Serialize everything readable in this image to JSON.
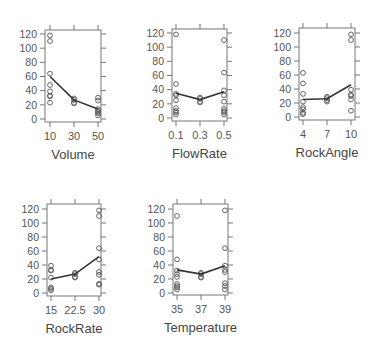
{
  "figure": {
    "title": "",
    "colors": {
      "text": "#555555",
      "box": "#777777",
      "points": "#555555",
      "trend": "#333333"
    }
  },
  "chart_data": [
    {
      "type": "scatter",
      "title": "",
      "xlabel": "Volume",
      "ylabel": "",
      "ylim": [
        0,
        120
      ],
      "yticks": [
        0,
        20,
        40,
        60,
        80,
        100,
        120
      ],
      "xticks": [
        10,
        30,
        50
      ],
      "xtick_labels": [
        "10",
        "30",
        "50"
      ],
      "grid": false,
      "points": [
        {
          "x": 10,
          "y": [
            118,
            110,
            64,
            48,
            39,
            33,
            32,
            23
          ]
        },
        {
          "x": 30,
          "y": [
            29,
            27,
            23,
            22
          ]
        },
        {
          "x": 50,
          "y": [
            30,
            26,
            14,
            12,
            10,
            8,
            5
          ]
        }
      ],
      "trend_line": [
        60,
        27,
        14
      ]
    },
    {
      "type": "scatter",
      "title": "",
      "xlabel": "FlowRate",
      "ylabel": "",
      "ylim": [
        0,
        120
      ],
      "yticks": [
        0,
        20,
        40,
        60,
        80,
        100,
        120
      ],
      "xticks": [
        0.1,
        0.3,
        0.5
      ],
      "xtick_labels": [
        "0.1",
        "0.3",
        "0.5"
      ],
      "grid": false,
      "points": [
        {
          "x": 0.1,
          "y": [
            118,
            48,
            34,
            32,
            25,
            14,
            10,
            8,
            5
          ]
        },
        {
          "x": 0.3,
          "y": [
            29,
            27,
            23,
            22
          ]
        },
        {
          "x": 0.5,
          "y": [
            110,
            64,
            39,
            32,
            23,
            13,
            10,
            8,
            5
          ]
        }
      ],
      "trend_line": [
        35,
        26,
        37
      ]
    },
    {
      "type": "scatter",
      "title": "",
      "xlabel": "RockAngle",
      "ylabel": "",
      "ylim": [
        0,
        120
      ],
      "yticks": [
        0,
        20,
        40,
        60,
        80,
        100,
        120
      ],
      "xticks": [
        4,
        7,
        10
      ],
      "xtick_labels": [
        "4",
        "7",
        "10"
      ],
      "grid": false,
      "points": [
        {
          "x": 4,
          "y": [
            63,
            48,
            33,
            22,
            14,
            11,
            6,
            4
          ]
        },
        {
          "x": 7,
          "y": [
            29,
            27,
            24,
            22
          ]
        },
        {
          "x": 10,
          "y": [
            118,
            110,
            39,
            32,
            30,
            25,
            9
          ]
        }
      ],
      "trend_line": [
        25,
        26,
        46
      ]
    },
    {
      "type": "scatter",
      "title": "",
      "xlabel": "RockRate",
      "ylabel": "",
      "ylim": [
        0,
        120
      ],
      "yticks": [
        0,
        20,
        40,
        60,
        80,
        100,
        120
      ],
      "xticks": [
        15,
        22.5,
        30
      ],
      "xtick_labels": [
        "15",
        "22.5",
        "30"
      ],
      "grid": false,
      "points": [
        {
          "x": 15,
          "y": [
            39,
            33,
            32,
            22,
            8,
            6,
            4
          ]
        },
        {
          "x": 22.5,
          "y": [
            29,
            27,
            23,
            22
          ]
        },
        {
          "x": 30,
          "y": [
            118,
            110,
            64,
            48,
            30,
            26,
            13,
            12
          ]
        }
      ],
      "trend_line": [
        20,
        27,
        52
      ]
    },
    {
      "type": "scatter",
      "title": "",
      "xlabel": "Temperature",
      "ylabel": "",
      "ylim": [
        0,
        120
      ],
      "yticks": [
        0,
        20,
        40,
        60,
        80,
        100,
        120
      ],
      "xticks": [
        35,
        37,
        39
      ],
      "xtick_labels": [
        "35",
        "37",
        "39"
      ],
      "grid": false,
      "points": [
        {
          "x": 35,
          "y": [
            110,
            48,
            32,
            27,
            23,
            13,
            10,
            8,
            5
          ]
        },
        {
          "x": 37,
          "y": [
            29,
            27,
            23,
            22
          ]
        },
        {
          "x": 39,
          "y": [
            118,
            64,
            39,
            33,
            30,
            14,
            10,
            5
          ]
        }
      ],
      "trend_line": [
        33,
        27,
        39
      ]
    }
  ]
}
